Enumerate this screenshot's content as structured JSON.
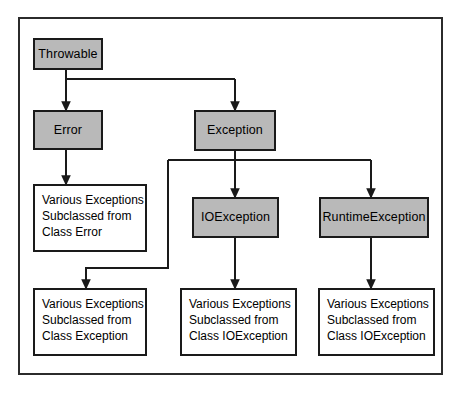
{
  "diagram": {
    "colors": {
      "class_box_fill": "#b9b9b9",
      "note_box_fill": "#ffffff",
      "stroke": "#1a1a1a",
      "frame_stroke": "#2b2b2b",
      "background": "#ffffff"
    },
    "nodes": {
      "throwable": {
        "label": "Throwable",
        "kind": "class"
      },
      "error": {
        "label": "Error",
        "kind": "class"
      },
      "exception": {
        "label": "Exception",
        "kind": "class"
      },
      "ioexception": {
        "label": "IOException",
        "kind": "class"
      },
      "runtimeexception": {
        "label": "RuntimeException",
        "kind": "class"
      },
      "note_error": {
        "kind": "note",
        "lines": [
          "Various Exceptions",
          "Subclassed from",
          "Class Error"
        ]
      },
      "note_exception": {
        "kind": "note",
        "lines": [
          "Various Exceptions",
          "Subclassed from",
          "Class Exception"
        ]
      },
      "note_ioexception": {
        "kind": "note",
        "lines": [
          "Various Exceptions",
          "Subclassed from",
          "Class IOException"
        ]
      },
      "note_runtimeexception": {
        "kind": "note",
        "lines": [
          "Various Exceptions",
          "Subclassed from",
          "Class IOException"
        ]
      }
    },
    "edges": [
      {
        "from": "throwable",
        "to": "error"
      },
      {
        "from": "throwable",
        "to": "exception"
      },
      {
        "from": "error",
        "to": "note_error"
      },
      {
        "from": "exception",
        "to": "note_exception"
      },
      {
        "from": "exception",
        "to": "ioexception"
      },
      {
        "from": "exception",
        "to": "runtimeexception"
      },
      {
        "from": "ioexception",
        "to": "note_ioexception"
      },
      {
        "from": "runtimeexception",
        "to": "note_runtimeexception"
      }
    ]
  }
}
